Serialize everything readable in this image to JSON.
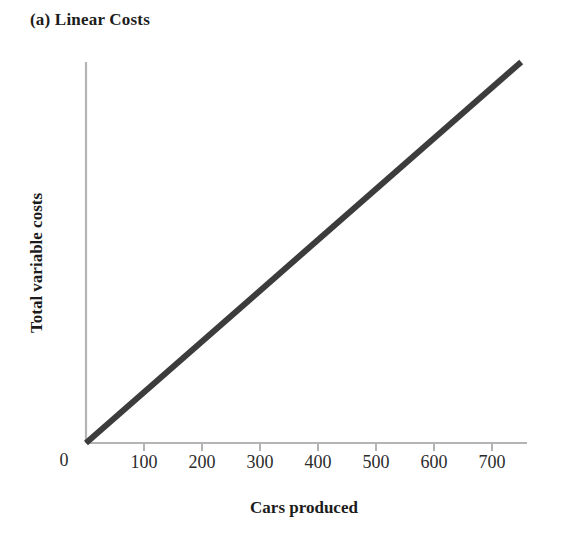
{
  "figure": {
    "panel_title": "(a) Linear Costs",
    "background_color": "#ffffff",
    "axis_color": "#b4b4b4",
    "line_color": "#3c3c3c",
    "text_color": "#1c1c1c"
  },
  "chart_data": {
    "type": "line",
    "title": "(a) Linear Costs",
    "xlabel": "Cars produced",
    "ylabel": "Total variable costs",
    "xlim": [
      0,
      760
    ],
    "ylim": [
      0,
      100
    ],
    "xticks": [
      100,
      200,
      300,
      400,
      500,
      600,
      700
    ],
    "xtick_labels": [
      "100",
      "200",
      "300",
      "400",
      "500",
      "600",
      "700"
    ],
    "origin_label": "0",
    "yticks": [],
    "ytick_labels": [],
    "grid": false,
    "legend": false,
    "series": [
      {
        "name": "Total variable costs",
        "color": "#3c3c3c",
        "linewidth": 6,
        "x": [
          0,
          750
        ],
        "y": [
          0,
          100
        ]
      }
    ],
    "annotations": []
  }
}
